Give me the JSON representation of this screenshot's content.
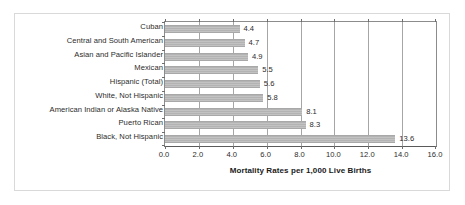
{
  "chart_data": {
    "type": "bar",
    "orientation": "horizontal",
    "title": "",
    "xlabel": "Mortality Rates per 1,000 Live Births",
    "ylabel": "",
    "xlim": [
      0.0,
      16.0
    ],
    "xticks": [
      "0.0",
      "2.0",
      "4.0",
      "6.0",
      "8.0",
      "10.0",
      "12.0",
      "14.0",
      "16.0"
    ],
    "xtick_values": [
      0.0,
      2.0,
      4.0,
      6.0,
      8.0,
      10.0,
      12.0,
      14.0,
      16.0
    ],
    "grid": true,
    "legend": false,
    "categories": [
      "Cuban",
      "Central and South American",
      "Asian and Pacific Islander",
      "Mexican",
      "Hispanic (Total)",
      "White, Not Hispanic",
      "American Indian or Alaska Native",
      "Puerto Rican",
      "Black, Not Hispanic"
    ],
    "values": [
      4.4,
      4.7,
      4.9,
      5.5,
      5.6,
      5.8,
      8.1,
      8.3,
      13.6
    ],
    "data_labels": [
      "4.4",
      "4.7",
      "4.9",
      "5.5",
      "5.6",
      "5.8",
      "8.1",
      "8.3",
      "13.6"
    ],
    "bar_color": "#b9b9b9",
    "axis_color": "#8c8c8c",
    "gridline_color": "#a6a6a6",
    "text_color": "#2b2b2b",
    "border_color": "#d9d9d9"
  }
}
